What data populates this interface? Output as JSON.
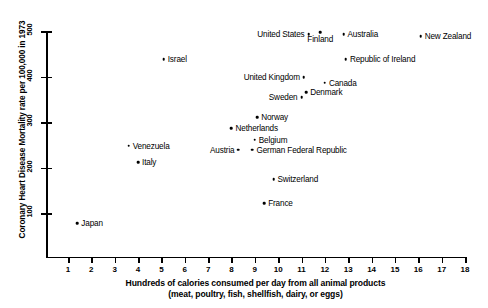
{
  "chart_data": {
    "type": "scatter",
    "title": "",
    "xlabel": "Hundreds of calories consumed per day from all animal products (meat, poultry, fish, shellfish, dairy, or eggs)",
    "xlabel_line1": "Hundreds of calories consumed per day from all animal products",
    "xlabel_line2": "(meat, poultry, fish, shellfish, dairy, or eggs)",
    "ylabel": "Coronary Heart Disease Mortality rate per 100,000 in 1973",
    "xlim": [
      0,
      18
    ],
    "ylim": [
      0,
      500
    ],
    "xticks": [
      1,
      2,
      3,
      4,
      5,
      6,
      7,
      8,
      9,
      10,
      11,
      12,
      13,
      14,
      15,
      16,
      17,
      18
    ],
    "yticks": [
      100,
      200,
      300,
      400,
      500
    ],
    "grid": false,
    "legend": "none",
    "points": [
      {
        "label": "United States",
        "x": 11.3,
        "y": 493,
        "label_pos": "left"
      },
      {
        "label": "Finland",
        "x": 11.8,
        "y": 498,
        "label_pos": "below"
      },
      {
        "label": "Australia",
        "x": 12.8,
        "y": 493,
        "label_pos": "right"
      },
      {
        "label": "New Zealand",
        "x": 16.1,
        "y": 489,
        "label_pos": "right"
      },
      {
        "label": "Israel",
        "x": 5.1,
        "y": 438,
        "label_pos": "right"
      },
      {
        "label": "Republic of Ireland",
        "x": 12.9,
        "y": 438,
        "label_pos": "right"
      },
      {
        "label": "United Kingdom",
        "x": 11.1,
        "y": 399,
        "label_pos": "left"
      },
      {
        "label": "Canada",
        "x": 12.0,
        "y": 386,
        "label_pos": "right"
      },
      {
        "label": "Denmark",
        "x": 11.2,
        "y": 366,
        "label_pos": "right"
      },
      {
        "label": "Sweden",
        "x": 11.0,
        "y": 355,
        "label_pos": "left"
      },
      {
        "label": "Norway",
        "x": 9.1,
        "y": 311,
        "label_pos": "right"
      },
      {
        "label": "Netherlands",
        "x": 8.0,
        "y": 287,
        "label_pos": "right"
      },
      {
        "label": "Belgium",
        "x": 9.0,
        "y": 261,
        "label_pos": "right"
      },
      {
        "label": "Austria",
        "x": 8.3,
        "y": 239,
        "label_pos": "left"
      },
      {
        "label": "German Federal Republic",
        "x": 8.9,
        "y": 239,
        "label_pos": "right"
      },
      {
        "label": "Venezuela",
        "x": 3.6,
        "y": 248,
        "label_pos": "right"
      },
      {
        "label": "Italy",
        "x": 4.0,
        "y": 211,
        "label_pos": "right"
      },
      {
        "label": "Switzerland",
        "x": 9.8,
        "y": 174,
        "label_pos": "right"
      },
      {
        "label": "France",
        "x": 9.4,
        "y": 121,
        "label_pos": "right"
      },
      {
        "label": "Japan",
        "x": 1.4,
        "y": 78,
        "label_pos": "right"
      }
    ]
  }
}
